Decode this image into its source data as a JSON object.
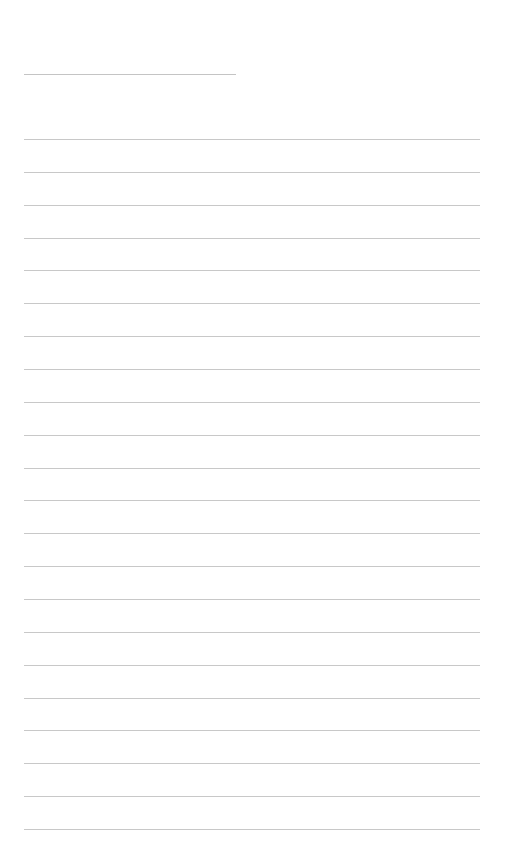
{
  "page": {
    "type": "blank lined notepad page",
    "background_color": "#ffffff",
    "line_color": "#c8c8c8",
    "title_line": {
      "present": true,
      "text": ""
    },
    "ruled_lines": {
      "count": 22,
      "spacing_px": 32.86,
      "text": []
    }
  }
}
